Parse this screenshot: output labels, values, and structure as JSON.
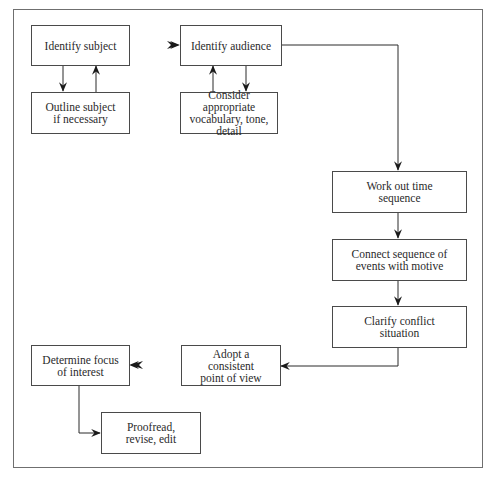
{
  "diagram": {
    "type": "flowchart",
    "nodes": [
      {
        "id": "identify-subject",
        "label": "Identify subject"
      },
      {
        "id": "outline-subject",
        "label": "Outline subject\nif necessary"
      },
      {
        "id": "identify-audience",
        "label": "Identify audience"
      },
      {
        "id": "consider-vocabulary",
        "label": "Consider appropriate\nvocabulary, tone,\ndetail"
      },
      {
        "id": "work-out-time",
        "label": "Work out time\nsequence"
      },
      {
        "id": "connect-sequence",
        "label": "Connect sequence of\nevents with motive"
      },
      {
        "id": "clarify-conflict",
        "label": "Clarify conflict\nsituation"
      },
      {
        "id": "adopt-point-of-view",
        "label": "Adopt a\nconsistent\npoint of view"
      },
      {
        "id": "determine-focus",
        "label": "Determine focus\nof interest"
      },
      {
        "id": "proofread",
        "label": "Proofread,\nrevise, edit"
      }
    ],
    "edges": [
      {
        "from": "identify-subject",
        "to": "outline-subject"
      },
      {
        "from": "outline-subject",
        "to": "identify-subject"
      },
      {
        "from": "identify-subject",
        "to": "identify-audience"
      },
      {
        "from": "identify-audience",
        "to": "consider-vocabulary"
      },
      {
        "from": "consider-vocabulary",
        "to": "identify-audience"
      },
      {
        "from": "identify-audience",
        "to": "work-out-time"
      },
      {
        "from": "work-out-time",
        "to": "connect-sequence"
      },
      {
        "from": "connect-sequence",
        "to": "clarify-conflict"
      },
      {
        "from": "clarify-conflict",
        "to": "adopt-point-of-view"
      },
      {
        "from": "adopt-point-of-view",
        "to": "determine-focus"
      },
      {
        "from": "determine-focus",
        "to": "proofread"
      }
    ]
  }
}
